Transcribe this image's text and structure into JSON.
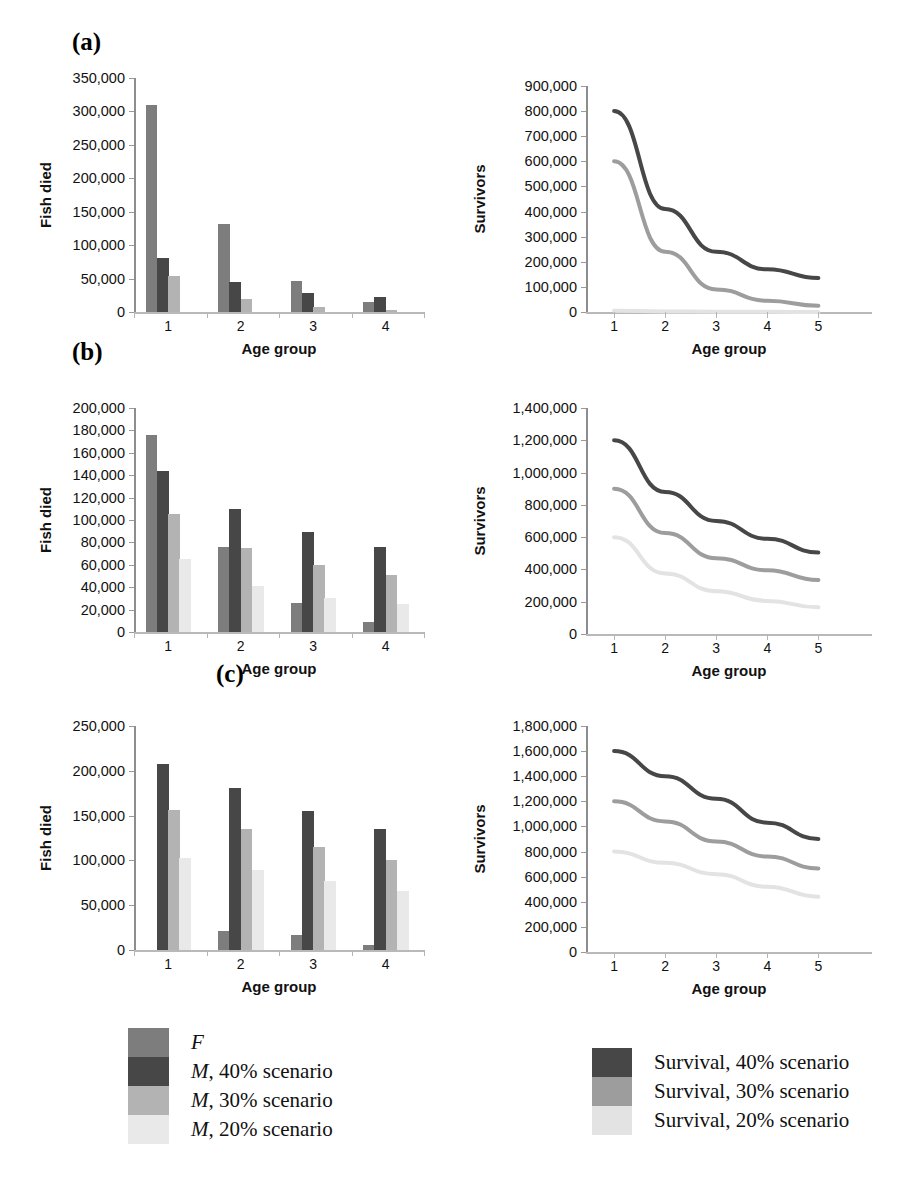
{
  "figure": {
    "panels": [
      {
        "label": "(a)"
      },
      {
        "label": "(b)"
      },
      {
        "label": "(c)"
      }
    ]
  },
  "axis_titles": {
    "fish_died": "Fish died",
    "survivors": "Survivors",
    "age_group": "Age group"
  },
  "legend_left": {
    "items": [
      {
        "label": "F",
        "italic_prefix": "F",
        "rest": "",
        "color": "#7d7d7d"
      },
      {
        "label": "M, 40% scenario",
        "italic_prefix": "M",
        "rest": ", 40% scenario",
        "color": "#474747"
      },
      {
        "label": "M, 30% scenario",
        "italic_prefix": "M",
        "rest": ", 30% scenario",
        "color": "#b3b3b3"
      },
      {
        "label": "M, 20% scenario",
        "italic_prefix": "M",
        "rest": ", 20% scenario",
        "color": "#e9e9e9"
      }
    ]
  },
  "legend_right": {
    "items": [
      {
        "label": "Survival, 40% scenario",
        "color": "#474747"
      },
      {
        "label": "Survival, 30% scenario",
        "color": "#9d9d9d"
      },
      {
        "label": "Survival, 20% scenario",
        "color": "#e3e3e3"
      }
    ]
  },
  "chart_data": [
    {
      "id": "a-bars",
      "panel": "(a)",
      "type": "bar",
      "title": "",
      "xlabel": "Age group",
      "ylabel": "Fish died",
      "categories": [
        "1",
        "2",
        "3",
        "4"
      ],
      "ylim": [
        0,
        350000
      ],
      "yticks": [
        "0",
        "50,000",
        "100,000",
        "150,000",
        "200,000",
        "250,000",
        "300,000",
        "350,000"
      ],
      "ytick_values": [
        0,
        50000,
        100000,
        150000,
        200000,
        250000,
        300000,
        350000
      ],
      "grid": false,
      "legend": "below-left",
      "series": [
        {
          "name": "F",
          "color": "#7d7d7d",
          "values": [
            310000,
            132000,
            46000,
            15000
          ]
        },
        {
          "name": "M, 40% scenario",
          "color": "#474747",
          "values": [
            81000,
            45000,
            29000,
            22000
          ]
        },
        {
          "name": "M, 30% scenario",
          "color": "#b3b3b3",
          "values": [
            54000,
            20000,
            7000,
            3000
          ]
        },
        {
          "name": "M, 20% scenario",
          "color": "#e9e9e9",
          "values": [
            0,
            0,
            0,
            0
          ]
        }
      ]
    },
    {
      "id": "a-lines",
      "panel": "(a)",
      "type": "line",
      "title": "",
      "xlabel": "Age group",
      "ylabel": "Survivors",
      "x": [
        "1",
        "2",
        "3",
        "4",
        "5"
      ],
      "ylim": [
        0,
        900000
      ],
      "yticks": [
        "0",
        "100,000",
        "200,000",
        "300,000",
        "400,000",
        "500,000",
        "600,000",
        "700,000",
        "800,000",
        "900,000"
      ],
      "ytick_values": [
        0,
        100000,
        200000,
        300000,
        400000,
        500000,
        600000,
        700000,
        800000,
        900000
      ],
      "grid": false,
      "legend": "below-right",
      "series": [
        {
          "name": "Survival, 40% scenario",
          "color": "#474747",
          "values": [
            800000,
            410000,
            240000,
            170000,
            135000
          ]
        },
        {
          "name": "Survival, 30% scenario",
          "color": "#9d9d9d",
          "values": [
            600000,
            240000,
            90000,
            45000,
            25000
          ]
        },
        {
          "name": "Survival, 20% scenario",
          "color": "#e3e3e3",
          "values": [
            5000,
            2000,
            1000,
            500,
            200
          ]
        }
      ]
    },
    {
      "id": "b-bars",
      "panel": "(b)",
      "type": "bar",
      "title": "",
      "xlabel": "Age group",
      "ylabel": "Fish died",
      "categories": [
        "1",
        "2",
        "3",
        "4"
      ],
      "ylim": [
        0,
        200000
      ],
      "yticks": [
        "0",
        "20,000",
        "40,000",
        "60,000",
        "80,000",
        "100,000",
        "120,000",
        "140,000",
        "160,000",
        "180,000",
        "200,000"
      ],
      "ytick_values": [
        0,
        20000,
        40000,
        60000,
        80000,
        100000,
        120000,
        140000,
        160000,
        180000,
        200000
      ],
      "grid": false,
      "legend": "below-left",
      "series": [
        {
          "name": "F",
          "color": "#7d7d7d",
          "values": [
            176000,
            76000,
            26000,
            9000
          ]
        },
        {
          "name": "M, 40% scenario",
          "color": "#474747",
          "values": [
            144000,
            110000,
            89000,
            76000
          ]
        },
        {
          "name": "M, 30% scenario",
          "color": "#b3b3b3",
          "values": [
            105000,
            75000,
            60000,
            51000
          ]
        },
        {
          "name": "M, 20% scenario",
          "color": "#e9e9e9",
          "values": [
            65000,
            41000,
            30000,
            25000
          ]
        }
      ]
    },
    {
      "id": "b-lines",
      "panel": "(b)",
      "type": "line",
      "title": "",
      "xlabel": "Age group",
      "ylabel": "Survivors",
      "x": [
        "1",
        "2",
        "3",
        "4",
        "5"
      ],
      "ylim": [
        0,
        1400000
      ],
      "yticks": [
        "0",
        "200,000",
        "400,000",
        "600,000",
        "800,000",
        "1,000,000",
        "1,200,000",
        "1,400,000"
      ],
      "ytick_values": [
        0,
        200000,
        400000,
        600000,
        800000,
        1000000,
        1200000,
        1400000
      ],
      "grid": false,
      "legend": "below-right",
      "series": [
        {
          "name": "Survival, 40% scenario",
          "color": "#474747",
          "values": [
            1200000,
            880000,
            700000,
            590000,
            505000
          ]
        },
        {
          "name": "Survival, 30% scenario",
          "color": "#9d9d9d",
          "values": [
            900000,
            625000,
            470000,
            395000,
            335000
          ]
        },
        {
          "name": "Survival, 20% scenario",
          "color": "#e3e3e3",
          "values": [
            600000,
            375000,
            265000,
            205000,
            165000
          ]
        }
      ]
    },
    {
      "id": "c-bars",
      "panel": "(c)",
      "type": "bar",
      "title": "",
      "xlabel": "Age group",
      "ylabel": "Fish died",
      "categories": [
        "1",
        "2",
        "3",
        "4"
      ],
      "ylim": [
        0,
        250000
      ],
      "yticks": [
        "0",
        "50,000",
        "100,000",
        "150,000",
        "200,000",
        "250,000"
      ],
      "ytick_values": [
        0,
        50000,
        100000,
        150000,
        200000,
        250000
      ],
      "grid": false,
      "legend": "below-left",
      "series": [
        {
          "name": "F",
          "color": "#7d7d7d",
          "values": [
            0,
            21000,
            17000,
            6000
          ]
        },
        {
          "name": "M, 40% scenario",
          "color": "#474747",
          "values": [
            208000,
            181000,
            155000,
            135000
          ]
        },
        {
          "name": "M, 30% scenario",
          "color": "#b3b3b3",
          "values": [
            156000,
            135000,
            115000,
            100000
          ]
        },
        {
          "name": "M, 20% scenario",
          "color": "#e9e9e9",
          "values": [
            103000,
            89000,
            77000,
            66000
          ]
        }
      ]
    },
    {
      "id": "c-lines",
      "panel": "(c)",
      "type": "line",
      "title": "",
      "xlabel": "Age group",
      "ylabel": "Survivors",
      "x": [
        "1",
        "2",
        "3",
        "4",
        "5"
      ],
      "ylim": [
        0,
        1800000
      ],
      "yticks": [
        "0",
        "200,000",
        "400,000",
        "600,000",
        "800,000",
        "1,000,000",
        "1,200,000",
        "1,400,000",
        "1,600,000",
        "1,800,000"
      ],
      "ytick_values": [
        0,
        200000,
        400000,
        600000,
        800000,
        1000000,
        1200000,
        1400000,
        1600000,
        1800000
      ],
      "grid": false,
      "legend": "below-right",
      "series": [
        {
          "name": "Survival, 40% scenario",
          "color": "#474747",
          "values": [
            1600000,
            1400000,
            1220000,
            1030000,
            900000
          ]
        },
        {
          "name": "Survival, 30% scenario",
          "color": "#9d9d9d",
          "values": [
            1200000,
            1040000,
            880000,
            760000,
            665000
          ]
        },
        {
          "name": "Survival, 20% scenario",
          "color": "#e3e3e3",
          "values": [
            800000,
            710000,
            620000,
            520000,
            440000
          ]
        }
      ]
    }
  ]
}
